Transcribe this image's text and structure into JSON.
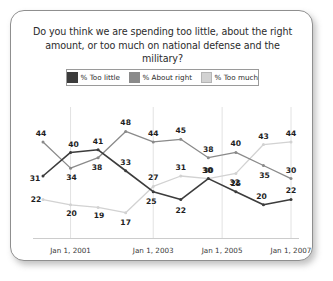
{
  "card": {
    "title": "Do you think we are spending too little, about the right amount, or too much on national defense and the military?"
  },
  "legend": {
    "items": [
      {
        "label": "% Too little",
        "color": "#3c3c3c"
      },
      {
        "label": "% About right",
        "color": "#8a8a8a"
      },
      {
        "label": "% Too much",
        "color": "#d2d2d2"
      }
    ]
  },
  "chart_data": {
    "type": "line",
    "title": "Do you think we are spending too little, about the right amount, or too much on national defense and the military?",
    "xlabel": "",
    "ylabel": "",
    "ylim": [
      10,
      52
    ],
    "grid": true,
    "legend_position": "top",
    "x_tick_labels": [
      "Jan 1, 2001",
      "Jan 1, 2003",
      "Jan 1, 2005",
      "Jan 1, 2007"
    ],
    "x_tick_indices": [
      1,
      4,
      6.5,
      9
    ],
    "x": [
      0,
      1,
      2,
      3,
      4,
      5,
      6,
      7,
      8,
      9
    ],
    "series": [
      {
        "name": "% Too little",
        "color": "#3c3c3c",
        "values": [
          31,
          40,
          41,
          33,
          25,
          22,
          30,
          25,
          20,
          22
        ]
      },
      {
        "name": "% About right",
        "color": "#8a8a8a",
        "values": [
          44,
          34,
          38,
          48,
          44,
          45,
          38,
          40,
          35,
          30
        ]
      },
      {
        "name": "% Too much",
        "color": "#d2d2d2",
        "values": [
          22,
          20,
          19,
          17,
          27,
          31,
          30,
          32,
          43,
          44
        ]
      }
    ],
    "point_labels": [
      {
        "series": 0,
        "index": 0,
        "text": "31",
        "dx": -8,
        "dy": 2
      },
      {
        "series": 0,
        "index": 1,
        "text": "40",
        "dx": 3,
        "dy": -8
      },
      {
        "series": 0,
        "index": 2,
        "text": "41",
        "dx": 0,
        "dy": -9
      },
      {
        "series": 0,
        "index": 3,
        "text": "33",
        "dx": 0,
        "dy": -9
      },
      {
        "series": 0,
        "index": 4,
        "text": "25",
        "dx": -2,
        "dy": 9
      },
      {
        "series": 0,
        "index": 5,
        "text": "22",
        "dx": 0,
        "dy": 10
      },
      {
        "series": 0,
        "index": 6,
        "text": "30",
        "dx": -1,
        "dy": -9
      },
      {
        "series": 0,
        "index": 7,
        "text": "25",
        "dx": 0,
        "dy": -9
      },
      {
        "series": 0,
        "index": 8,
        "text": "20",
        "dx": -2,
        "dy": -9
      },
      {
        "series": 0,
        "index": 9,
        "text": "22",
        "dx": 0,
        "dy": -10
      },
      {
        "series": 1,
        "index": 0,
        "text": "44",
        "dx": -2,
        "dy": -9
      },
      {
        "series": 1,
        "index": 1,
        "text": "34",
        "dx": 1,
        "dy": 9
      },
      {
        "series": 1,
        "index": 2,
        "text": "38",
        "dx": -1,
        "dy": 9
      },
      {
        "series": 1,
        "index": 3,
        "text": "48",
        "dx": 0,
        "dy": -9
      },
      {
        "series": 1,
        "index": 4,
        "text": "44",
        "dx": 0,
        "dy": -9
      },
      {
        "series": 1,
        "index": 5,
        "text": "45",
        "dx": 0,
        "dy": -9
      },
      {
        "series": 1,
        "index": 6,
        "text": "38",
        "dx": 0,
        "dy": -9
      },
      {
        "series": 1,
        "index": 7,
        "text": "40",
        "dx": 0,
        "dy": -9
      },
      {
        "series": 1,
        "index": 8,
        "text": "35",
        "dx": 1,
        "dy": 9
      },
      {
        "series": 1,
        "index": 9,
        "text": "30",
        "dx": 0,
        "dy": -9
      },
      {
        "series": 2,
        "index": 0,
        "text": "22",
        "dx": -7,
        "dy": -1
      },
      {
        "series": 2,
        "index": 1,
        "text": "20",
        "dx": 1,
        "dy": 8
      },
      {
        "series": 2,
        "index": 2,
        "text": "19",
        "dx": 1,
        "dy": 8
      },
      {
        "series": 2,
        "index": 3,
        "text": "17",
        "dx": 0,
        "dy": 9
      },
      {
        "series": 2,
        "index": 4,
        "text": "27",
        "dx": 0,
        "dy": -9
      },
      {
        "series": 2,
        "index": 5,
        "text": "31",
        "dx": 0,
        "dy": -9
      },
      {
        "series": 2,
        "index": 6,
        "text": "30",
        "dx": 0,
        "dy": -9
      },
      {
        "series": 2,
        "index": 7,
        "text": "32",
        "dx": -1,
        "dy": 9
      },
      {
        "series": 2,
        "index": 8,
        "text": "43",
        "dx": 0,
        "dy": -9
      },
      {
        "series": 2,
        "index": 9,
        "text": "44",
        "dx": 0,
        "dy": -9
      }
    ]
  }
}
